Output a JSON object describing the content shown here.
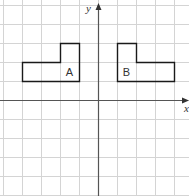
{
  "diagram": {
    "type": "coordinate-grid-reflection",
    "grid": {
      "unit_px": 19,
      "origin_px": [
        98,
        100
      ],
      "x_range": [
        -5,
        4
      ],
      "y_range": [
        -5,
        5
      ],
      "line_color": "#d4d4d4"
    },
    "axes": {
      "x_label": "x",
      "y_label": "y",
      "color": "#555555"
    },
    "shapes": [
      {
        "label": "A",
        "vertices": [
          [
            -2,
            3
          ],
          [
            -1,
            3
          ],
          [
            -1,
            1
          ],
          [
            -4,
            1
          ],
          [
            -4,
            2
          ],
          [
            -2,
            2
          ]
        ],
        "label_pos": [
          -1.5,
          1.5
        ]
      },
      {
        "label": "B",
        "vertices": [
          [
            1,
            3
          ],
          [
            2,
            3
          ],
          [
            2,
            2
          ],
          [
            4,
            2
          ],
          [
            4,
            1
          ],
          [
            1,
            1
          ]
        ],
        "label_pos": [
          1.5,
          1.5
        ]
      }
    ],
    "shape_stroke": "#1a1a1a"
  }
}
